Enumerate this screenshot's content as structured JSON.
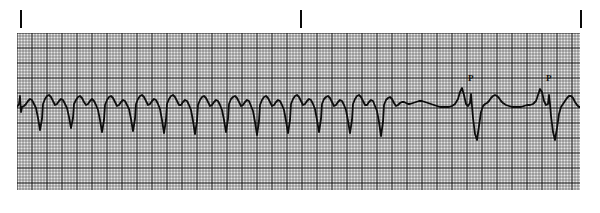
{
  "figure": {
    "kind": "ecg-rhythm-strip",
    "width": 600,
    "height": 213,
    "background_color": "#ffffff",
    "trace_color": "#0d0d0d",
    "grid_paper_color": "#e8e8e8",
    "grid_minor_color": "#3a3a3a",
    "grid_major_color": "#0d0d0d"
  },
  "tick_marks": [
    {
      "label": "",
      "x": 20
    },
    {
      "label": "",
      "x": 300
    },
    {
      "label": "",
      "x": 580
    }
  ],
  "grid": {
    "left": 17,
    "top": 33,
    "width": 563,
    "height": 157,
    "minor_cell_px": 3,
    "major_every": 5,
    "minor_width": 0.5,
    "major_width": 1.0
  },
  "annotations": [
    {
      "text": "P",
      "x": 470,
      "y": 82
    },
    {
      "text": "P",
      "x": 545,
      "y": 82
    }
  ],
  "chart_data": {
    "type": "line",
    "title": "",
    "xlabel": "",
    "ylabel": "",
    "baseline_y_px": 108,
    "mm_per_small_cell": 1,
    "paper_speed_mm_per_s": 25,
    "gain_mm_per_mV": 10,
    "grid": "on",
    "legend": "none",
    "trace_points": [
      [
        17,
        107
      ],
      [
        19,
        104
      ],
      [
        20,
        96
      ],
      [
        21,
        112
      ],
      [
        22,
        107
      ],
      [
        24,
        106
      ],
      [
        26,
        104
      ],
      [
        28,
        101
      ],
      [
        30,
        99
      ],
      [
        32,
        100
      ],
      [
        34,
        104
      ],
      [
        36,
        108
      ],
      [
        38,
        118
      ],
      [
        40,
        130
      ],
      [
        42,
        119
      ],
      [
        43,
        104
      ],
      [
        45,
        99
      ],
      [
        47,
        96
      ],
      [
        49,
        95
      ],
      [
        51,
        97
      ],
      [
        53,
        101
      ],
      [
        55,
        105
      ],
      [
        57,
        104
      ],
      [
        59,
        101
      ],
      [
        61,
        99
      ],
      [
        63,
        100
      ],
      [
        65,
        104
      ],
      [
        67,
        108
      ],
      [
        69,
        117
      ],
      [
        71,
        128
      ],
      [
        73,
        118
      ],
      [
        74,
        104
      ],
      [
        76,
        100
      ],
      [
        78,
        97
      ],
      [
        80,
        96
      ],
      [
        82,
        98
      ],
      [
        84,
        102
      ],
      [
        86,
        105
      ],
      [
        88,
        104
      ],
      [
        90,
        101
      ],
      [
        92,
        99
      ],
      [
        94,
        101
      ],
      [
        96,
        105
      ],
      [
        98,
        110
      ],
      [
        100,
        120
      ],
      [
        102,
        132
      ],
      [
        104,
        120
      ],
      [
        105,
        105
      ],
      [
        107,
        100
      ],
      [
        109,
        97
      ],
      [
        111,
        96
      ],
      [
        113,
        98
      ],
      [
        115,
        102
      ],
      [
        117,
        106
      ],
      [
        119,
        105
      ],
      [
        121,
        102
      ],
      [
        123,
        100
      ],
      [
        125,
        101
      ],
      [
        127,
        105
      ],
      [
        129,
        109
      ],
      [
        131,
        119
      ],
      [
        133,
        131
      ],
      [
        135,
        119
      ],
      [
        136,
        104
      ],
      [
        138,
        99
      ],
      [
        140,
        96
      ],
      [
        142,
        95
      ],
      [
        144,
        97
      ],
      [
        146,
        101
      ],
      [
        148,
        105
      ],
      [
        150,
        104
      ],
      [
        152,
        101
      ],
      [
        154,
        99
      ],
      [
        156,
        100
      ],
      [
        158,
        104
      ],
      [
        160,
        109
      ],
      [
        162,
        120
      ],
      [
        164,
        133
      ],
      [
        166,
        120
      ],
      [
        167,
        104
      ],
      [
        169,
        99
      ],
      [
        171,
        96
      ],
      [
        173,
        95
      ],
      [
        175,
        97
      ],
      [
        177,
        101
      ],
      [
        179,
        105
      ],
      [
        181,
        105
      ],
      [
        183,
        102
      ],
      [
        185,
        100
      ],
      [
        187,
        101
      ],
      [
        189,
        105
      ],
      [
        191,
        110
      ],
      [
        193,
        121
      ],
      [
        195,
        134
      ],
      [
        197,
        121
      ],
      [
        198,
        105
      ],
      [
        200,
        100
      ],
      [
        202,
        97
      ],
      [
        204,
        96
      ],
      [
        206,
        98
      ],
      [
        208,
        102
      ],
      [
        210,
        106
      ],
      [
        212,
        105
      ],
      [
        214,
        102
      ],
      [
        216,
        100
      ],
      [
        218,
        101
      ],
      [
        220,
        105
      ],
      [
        222,
        110
      ],
      [
        224,
        120
      ],
      [
        226,
        132
      ],
      [
        228,
        119
      ],
      [
        229,
        104
      ],
      [
        231,
        99
      ],
      [
        233,
        97
      ],
      [
        235,
        96
      ],
      [
        237,
        98
      ],
      [
        239,
        102
      ],
      [
        241,
        106
      ],
      [
        243,
        105
      ],
      [
        245,
        102
      ],
      [
        247,
        100
      ],
      [
        249,
        101
      ],
      [
        251,
        106
      ],
      [
        253,
        111
      ],
      [
        255,
        122
      ],
      [
        257,
        135
      ],
      [
        259,
        121
      ],
      [
        260,
        105
      ],
      [
        262,
        100
      ],
      [
        264,
        97
      ],
      [
        266,
        96
      ],
      [
        268,
        98
      ],
      [
        270,
        102
      ],
      [
        272,
        106
      ],
      [
        274,
        105
      ],
      [
        276,
        102
      ],
      [
        278,
        100
      ],
      [
        280,
        101
      ],
      [
        282,
        105
      ],
      [
        284,
        110
      ],
      [
        286,
        121
      ],
      [
        288,
        133
      ],
      [
        290,
        120
      ],
      [
        291,
        104
      ],
      [
        293,
        99
      ],
      [
        295,
        96
      ],
      [
        297,
        95
      ],
      [
        299,
        97
      ],
      [
        301,
        101
      ],
      [
        303,
        105
      ],
      [
        305,
        104
      ],
      [
        307,
        101
      ],
      [
        309,
        99
      ],
      [
        311,
        100
      ],
      [
        313,
        104
      ],
      [
        315,
        109
      ],
      [
        317,
        120
      ],
      [
        319,
        132
      ],
      [
        321,
        119
      ],
      [
        322,
        104
      ],
      [
        324,
        99
      ],
      [
        326,
        97
      ],
      [
        328,
        96
      ],
      [
        330,
        98
      ],
      [
        332,
        102
      ],
      [
        334,
        106
      ],
      [
        336,
        105
      ],
      [
        338,
        102
      ],
      [
        340,
        100
      ],
      [
        342,
        101
      ],
      [
        344,
        105
      ],
      [
        346,
        110
      ],
      [
        348,
        121
      ],
      [
        350,
        133
      ],
      [
        352,
        120
      ],
      [
        353,
        104
      ],
      [
        355,
        99
      ],
      [
        357,
        96
      ],
      [
        359,
        95
      ],
      [
        361,
        97
      ],
      [
        363,
        101
      ],
      [
        365,
        105
      ],
      [
        367,
        105
      ],
      [
        369,
        102
      ],
      [
        371,
        100
      ],
      [
        373,
        101
      ],
      [
        375,
        106
      ],
      [
        377,
        111
      ],
      [
        379,
        122
      ],
      [
        381,
        136
      ],
      [
        383,
        122
      ],
      [
        384,
        105
      ],
      [
        386,
        100
      ],
      [
        388,
        98
      ],
      [
        390,
        97
      ],
      [
        392,
        99
      ],
      [
        394,
        103
      ],
      [
        396,
        106
      ],
      [
        398,
        105
      ],
      [
        400,
        103
      ],
      [
        402,
        102
      ],
      [
        404,
        102
      ],
      [
        406,
        103
      ],
      [
        408,
        104
      ],
      [
        410,
        104
      ],
      [
        413,
        103
      ],
      [
        416,
        102
      ],
      [
        419,
        101
      ],
      [
        422,
        101
      ],
      [
        425,
        102
      ],
      [
        428,
        103
      ],
      [
        431,
        104
      ],
      [
        434,
        105
      ],
      [
        437,
        106
      ],
      [
        440,
        107
      ],
      [
        443,
        107
      ],
      [
        446,
        107
      ],
      [
        449,
        107
      ],
      [
        452,
        106
      ],
      [
        455,
        104
      ],
      [
        458,
        99
      ],
      [
        460,
        92
      ],
      [
        462,
        88
      ],
      [
        464,
        95
      ],
      [
        466,
        104
      ],
      [
        468,
        106
      ],
      [
        470,
        103
      ],
      [
        471,
        94
      ],
      [
        472,
        106
      ],
      [
        473,
        118
      ],
      [
        475,
        134
      ],
      [
        477,
        140
      ],
      [
        479,
        126
      ],
      [
        481,
        112
      ],
      [
        483,
        106
      ],
      [
        485,
        104
      ],
      [
        487,
        103
      ],
      [
        489,
        101
      ],
      [
        491,
        98
      ],
      [
        493,
        96
      ],
      [
        495,
        95
      ],
      [
        497,
        96
      ],
      [
        499,
        98
      ],
      [
        501,
        101
      ],
      [
        503,
        103
      ],
      [
        506,
        105
      ],
      [
        509,
        106
      ],
      [
        512,
        107
      ],
      [
        515,
        107
      ],
      [
        518,
        107
      ],
      [
        521,
        107
      ],
      [
        524,
        106
      ],
      [
        527,
        105
      ],
      [
        530,
        105
      ],
      [
        533,
        104
      ],
      [
        536,
        101
      ],
      [
        538,
        95
      ],
      [
        540,
        89
      ],
      [
        542,
        92
      ],
      [
        544,
        101
      ],
      [
        546,
        105
      ],
      [
        548,
        104
      ],
      [
        549,
        95
      ],
      [
        550,
        104
      ],
      [
        551,
        116
      ],
      [
        553,
        132
      ],
      [
        555,
        140
      ],
      [
        557,
        128
      ],
      [
        559,
        114
      ],
      [
        561,
        107
      ],
      [
        563,
        104
      ],
      [
        565,
        101
      ],
      [
        567,
        98
      ],
      [
        569,
        96
      ],
      [
        571,
        96
      ],
      [
        573,
        98
      ],
      [
        575,
        102
      ],
      [
        577,
        105
      ],
      [
        579,
        107
      ],
      [
        580,
        107
      ]
    ]
  }
}
